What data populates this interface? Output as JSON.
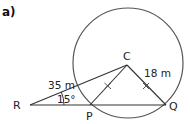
{
  "part_label": "a)",
  "diagram": {
    "circle": {
      "cx": 128,
      "cy": 63,
      "r": 55,
      "stroke": "#555555"
    },
    "points": {
      "C": {
        "label": "C",
        "x": 127,
        "y": 65
      },
      "R": {
        "label": "R",
        "x": 30,
        "y": 105
      },
      "P": {
        "label": "P",
        "x": 90,
        "y": 105
      },
      "Q": {
        "label": "Q",
        "x": 166,
        "y": 105
      }
    },
    "measurements": {
      "RC_length": "35 m",
      "CQ_length": "18 m",
      "angle_R": "15°"
    },
    "equal_marks": [
      "CP",
      "CQ"
    ],
    "line_color": "#333333"
  }
}
